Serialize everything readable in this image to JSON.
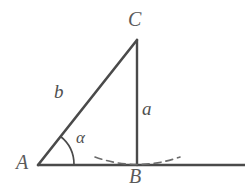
{
  "figure": {
    "type": "right-triangle-diagram",
    "background_color": "#ffffff",
    "stroke_color": "#4a4a4a",
    "label_color": "#555555",
    "vertices": {
      "A": {
        "label": "A",
        "x": 38,
        "y": 165
      },
      "B": {
        "label": "B",
        "x": 137,
        "y": 165
      },
      "C": {
        "label": "C",
        "x": 137,
        "y": 40
      }
    },
    "sides": {
      "a": {
        "label": "a",
        "from": "B",
        "to": "C"
      },
      "b": {
        "label": "b",
        "from": "A",
        "to": "C"
      }
    },
    "angles": {
      "alpha": {
        "label": "α",
        "at": "A"
      }
    },
    "baseline": {
      "from_x": 38,
      "to_x": 245,
      "y": 165
    },
    "dashed_arc": {
      "center_x": 137,
      "center_y": 165,
      "from_x": 95,
      "to_x": 180
    }
  }
}
